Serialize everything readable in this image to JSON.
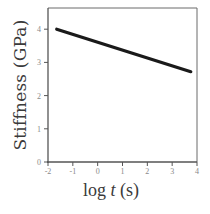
{
  "chart_data": {
    "type": "line",
    "title": "",
    "xlabel": "log t (s)",
    "xlabel_parts": {
      "prefix": "log ",
      "italic": "t",
      "suffix": " (s)"
    },
    "ylabel": "Stiffness (GPa)",
    "xlim": [
      -2,
      4
    ],
    "ylim": [
      0,
      4.6
    ],
    "x_ticks": [
      -2,
      -1,
      0,
      1,
      2,
      3,
      4
    ],
    "y_ticks": [
      0,
      1,
      2,
      3,
      4
    ],
    "x_tick_labels": [
      "-2",
      "-1",
      "0",
      "1",
      "2",
      "3",
      "4"
    ],
    "y_tick_labels": [
      "0",
      "1",
      "2",
      "3",
      "4"
    ],
    "grid": false,
    "legend": null,
    "series": [
      {
        "name": "Stiffness",
        "x": [
          -1.65,
          3.75
        ],
        "y": [
          4.0,
          2.72
        ],
        "color": "#1a1a1a"
      }
    ]
  },
  "colors": {
    "line": "#1a1a1a",
    "axis": "#555555",
    "tick_label": "#8a8a8a",
    "label": "#3a3a3a"
  }
}
